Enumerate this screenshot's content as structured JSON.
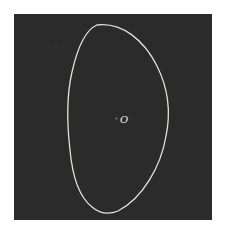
{
  "figure": {
    "background_color": "#ffffff",
    "panel": {
      "color": "#2b2b2b",
      "x": 14,
      "y": 14,
      "width": 198,
      "height": 206
    },
    "contour": {
      "stroke_color": "#e4e2d6",
      "stroke_width": 1.3,
      "path": "M 97 25 C 122 22, 144 40, 157 66 C 168 88, 171 112, 166 136 C 161 166, 143 198, 118 211 C 108 215, 99 213, 92 207 C 78 196, 72 172, 70 150 C 67 124, 66 98, 72 72 C 77 50, 85 30, 97 25 Z"
    },
    "center_point": {
      "x": 116.5,
      "y": 118.5,
      "radius": 1,
      "color": "#8a8a8a"
    },
    "center_label": {
      "text": "O",
      "x": 120,
      "y": 123,
      "color": "#f0f0f0"
    },
    "noise_dot": {
      "x": 56,
      "y": 46,
      "radius": 0.8,
      "color": "#4a4a4a"
    }
  }
}
